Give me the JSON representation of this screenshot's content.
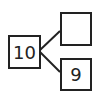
{
  "number_bond": {
    "whole": "10",
    "part_top": "",
    "part_bottom": "9"
  }
}
